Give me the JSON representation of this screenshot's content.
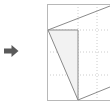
{
  "figure": {
    "title": "",
    "canvas": {
      "width": 110,
      "height": 105,
      "background": "#ffffff"
    },
    "arrow": {
      "icon": "right-arrow-icon",
      "direction": "right",
      "color": "#555555",
      "x": 4,
      "y": 44,
      "width": 16,
      "height": 14
    },
    "plot_frame": {
      "left": 47,
      "top": 4,
      "right": 110,
      "bottom": 100,
      "border_color": "#b8b8b8",
      "border_width": 1,
      "clipped_right": true
    },
    "grid": {
      "visible": true,
      "style": "dotted",
      "color": "#cccccc",
      "vertical_lines": [
        78,
        97
      ],
      "horizontal_lines": [
        30,
        52,
        75
      ]
    },
    "shapes": [
      {
        "name": "filled-quadrilateral",
        "type": "polygon",
        "fill": "#f2f2f2",
        "stroke": "#8a8a8a",
        "stroke_width": 1,
        "points": "48,30 78,30 78,100 48,30"
      },
      {
        "name": "upper-diagonal-edge",
        "type": "line",
        "stroke": "#8a8a8a",
        "stroke_width": 1,
        "x1": 48,
        "y1": 30,
        "x2": 110,
        "y2": 6
      },
      {
        "name": "lower-diagonal-edge",
        "type": "line",
        "stroke": "#8a8a8a",
        "stroke_width": 1,
        "x1": 78,
        "y1": 100,
        "x2": 110,
        "y2": 87
      },
      {
        "name": "vertical-edge",
        "type": "line",
        "stroke": "#8a8a8a",
        "stroke_width": 1,
        "x1": 78,
        "y1": 30,
        "x2": 78,
        "y2": 100
      },
      {
        "name": "left-slanted-edge",
        "type": "line",
        "stroke": "#8a8a8a",
        "stroke_width": 1,
        "x1": 48,
        "y1": 30,
        "x2": 78,
        "y2": 100
      },
      {
        "name": "top-horizontal-edge",
        "type": "line",
        "stroke": "#8a8a8a",
        "stroke_width": 1,
        "x1": 48,
        "y1": 30,
        "x2": 78,
        "y2": 30
      }
    ]
  }
}
